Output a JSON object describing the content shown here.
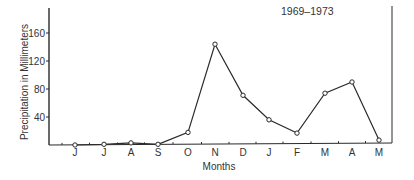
{
  "chart_data": {
    "type": "line",
    "title": "1969–1973",
    "xlabel": "Months",
    "ylabel": "Precipitation in Millimeters",
    "categories": [
      "J",
      "J",
      "A",
      "S",
      "O",
      "N",
      "D",
      "J",
      "F",
      "M",
      "A",
      "M"
    ],
    "series": [
      {
        "name": "Precipitation",
        "values": [
          0,
          1,
          3,
          1,
          18,
          144,
          71,
          36,
          17,
          74,
          90,
          7
        ]
      }
    ],
    "yticks": [
      40,
      80,
      120,
      160
    ],
    "ylim": [
      0,
      195
    ],
    "grid": false,
    "legend": "none",
    "marker": "open-circle"
  }
}
